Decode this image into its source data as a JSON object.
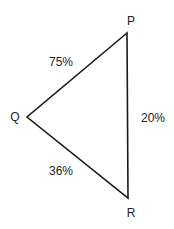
{
  "diagram": {
    "type": "triangle",
    "vertices": [
      {
        "id": "P",
        "label": "P",
        "x": 127,
        "y": 33,
        "label_x": 131,
        "label_y": 25
      },
      {
        "id": "Q",
        "label": "Q",
        "x": 27,
        "y": 117,
        "label_x": 15,
        "label_y": 121
      },
      {
        "id": "R",
        "label": "R",
        "x": 128,
        "y": 198,
        "label_x": 131,
        "label_y": 217
      }
    ],
    "edges": [
      {
        "from": "Q",
        "to": "P",
        "label": "75%",
        "label_x": 61,
        "label_y": 66
      },
      {
        "from": "P",
        "to": "R",
        "label": "20%",
        "label_x": 153,
        "label_y": 122
      },
      {
        "from": "Q",
        "to": "R",
        "label": "36%",
        "label_x": 61,
        "label_y": 175
      }
    ],
    "colors": {
      "line": "#1a1a1a",
      "text": "#222222",
      "background": "#ffffff"
    }
  }
}
